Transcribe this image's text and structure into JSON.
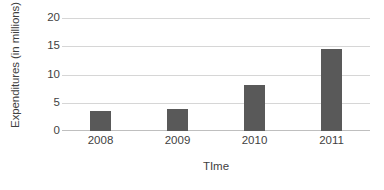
{
  "chart_data": {
    "type": "bar",
    "title": "",
    "subtitle": "",
    "xlabel": "TIme",
    "ylabel": "Expenditures (in millions)",
    "categories": [
      "2008",
      "2009",
      "2010",
      "2011"
    ],
    "values": [
      3.6,
      3.9,
      8.1,
      14.5
    ],
    "series": [
      {
        "name": "Expenditures",
        "values": [
          3.6,
          3.9,
          8.1,
          14.5
        ]
      }
    ],
    "ylim": [
      0,
      20
    ],
    "y_ticks": [
      0,
      5,
      10,
      15,
      20
    ],
    "y_tick_labels": [
      "0",
      "5",
      "10",
      "15",
      "20"
    ],
    "grid": true,
    "grid_axis": "y",
    "legend": false,
    "legend_position": "none",
    "bar_color": "#595959",
    "gridline_color": "#d6d6d6",
    "axis_line_color": "#bfbfbf",
    "text_color": "#3f3f3f",
    "background_color": "#ffffff"
  }
}
